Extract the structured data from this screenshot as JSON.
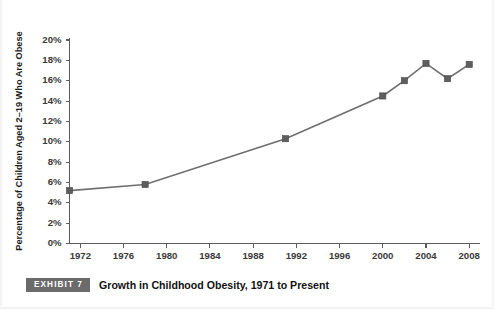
{
  "chart_data": {
    "type": "line",
    "title": "",
    "xlabel": "",
    "ylabel": "Percentage of Children Aged 2–19 Who Are Obese",
    "xlim": [
      1971,
      2009
    ],
    "ylim": [
      0,
      20
    ],
    "grid": false,
    "legend": null,
    "x_tick_labels": [
      "1972",
      "1976",
      "1980",
      "1984",
      "1988",
      "1992",
      "1996",
      "2000",
      "2004",
      "2008"
    ],
    "x_ticks": [
      1972,
      1976,
      1980,
      1984,
      1988,
      1992,
      1996,
      2000,
      2004,
      2008
    ],
    "y_tick_labels": [
      "0%",
      "2%",
      "4%",
      "6%",
      "8%",
      "10%",
      "12%",
      "14%",
      "16%",
      "18%",
      "20%"
    ],
    "y_ticks": [
      0,
      2,
      4,
      6,
      8,
      10,
      12,
      14,
      16,
      18,
      20
    ],
    "series": [
      {
        "name": "Children aged 2–19 who are obese",
        "color": "#6f6f6f",
        "marker": "square",
        "x": [
          1971,
          1978,
          1991,
          2000,
          2002,
          2004,
          2006,
          2008
        ],
        "values": [
          5.2,
          5.8,
          10.3,
          14.5,
          16.0,
          17.7,
          16.2,
          17.6
        ]
      }
    ]
  },
  "caption": {
    "badge": "EXHIBIT 7",
    "text": "Growth in Childhood Obesity, 1971 to Present"
  },
  "colors": {
    "series": "#6f6f6f",
    "axis": "#5c5c5c",
    "badge_bg": "#6b6b6b",
    "text": "#121212"
  }
}
